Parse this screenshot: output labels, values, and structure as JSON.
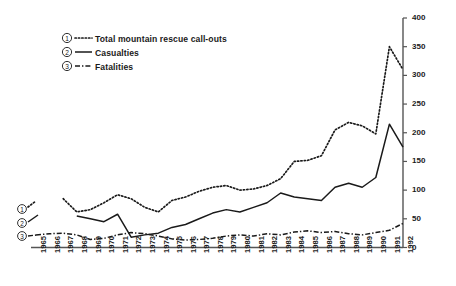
{
  "chart_data": {
    "type": "line",
    "title": "",
    "subtitle": "",
    "xlabel": "",
    "ylabel": "",
    "ylim": [
      0,
      400
    ],
    "ytick_step": 50,
    "yticks": [
      "0",
      "50",
      "100",
      "150",
      "200",
      "250",
      "300",
      "350",
      "400"
    ],
    "y_axis_position": "right",
    "grid": false,
    "legend_position": "top-left",
    "x": [
      1965,
      1966,
      1967,
      1968,
      1969,
      1970,
      1971,
      1972,
      1973,
      1974,
      1975,
      1976,
      1977,
      1978,
      1979,
      1980,
      1981,
      1982,
      1983,
      1984,
      1985,
      1986,
      1987,
      1988,
      1989,
      1990,
      1991,
      1992
    ],
    "xtick_labels": [
      "1965",
      "1966",
      "1967",
      "1968",
      "1969",
      "1970",
      "1971",
      "1972",
      "1973",
      "1974",
      "1975",
      "1976",
      "1977",
      "1978",
      "1979",
      "1980",
      "1981",
      "1982",
      "1983",
      "1984",
      "1985",
      "1986",
      "1987",
      "1988",
      "1989",
      "1990",
      "1991",
      "1992"
    ],
    "series": [
      {
        "number": "1",
        "name": "Total mountain rescue call-outs",
        "style": "dotted",
        "values": [
          null,
          null,
          85,
          62,
          66,
          78,
          92,
          85,
          70,
          62,
          82,
          88,
          98,
          105,
          108,
          100,
          102,
          108,
          120,
          150,
          152,
          160,
          205,
          218,
          212,
          198,
          350,
          310
        ]
      },
      {
        "number": "2",
        "name": "Casualties",
        "style": "solid",
        "values": [
          null,
          null,
          null,
          55,
          50,
          45,
          58,
          18,
          22,
          25,
          35,
          40,
          50,
          60,
          66,
          62,
          70,
          78,
          95,
          88,
          85,
          82,
          105,
          112,
          105,
          122,
          215,
          175
        ]
      },
      {
        "number": "3",
        "name": "Fatalities",
        "style": "dash-dot",
        "values": [
          22,
          24,
          25,
          22,
          14,
          16,
          22,
          26,
          24,
          20,
          15,
          13,
          14,
          16,
          20,
          22,
          20,
          24,
          22,
          27,
          29,
          26,
          28,
          24,
          22,
          26,
          30,
          42
        ]
      }
    ]
  },
  "legend": {
    "items": [
      {
        "number": "1",
        "label": "Total mountain rescue call-outs"
      },
      {
        "number": "2",
        "label": "Casualties"
      },
      {
        "number": "3",
        "label": "Fatalities"
      }
    ]
  },
  "colors": {
    "ink": "#1a1a1a",
    "axis": "#555555",
    "background": "#ffffff"
  }
}
